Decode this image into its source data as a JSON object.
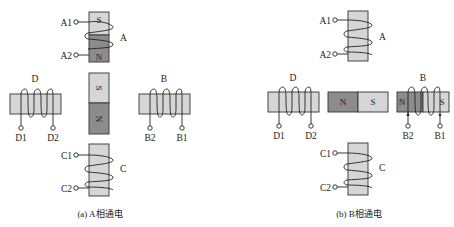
{
  "panels": [
    {
      "id": "a",
      "caption": "(a) A相通电",
      "coils": {
        "A": {
          "label": "A",
          "t1": "A1",
          "t2": "A2",
          "pole_top": "S",
          "pole_bottom": "N"
        },
        "B": {
          "label": "B",
          "t1": "B2",
          "t2": "B1"
        },
        "C": {
          "label": "C",
          "t1": "C2",
          "t2": "C1"
        },
        "D": {
          "label": "D",
          "t1": "D1",
          "t2": "D2"
        }
      },
      "rotor": {
        "top": "S",
        "bottom": "N",
        "orientation": "vertical"
      }
    },
    {
      "id": "b",
      "caption": "(b) B相通电",
      "coils": {
        "A": {
          "label": "A",
          "t1": "A1",
          "t2": "A2"
        },
        "B": {
          "label": "B",
          "t1": "B2",
          "t2": "B1",
          "pole_left": "N",
          "pole_right": "S"
        },
        "C": {
          "label": "C",
          "t1": "C2",
          "t2": "C1"
        },
        "D": {
          "label": "D",
          "t1": "D1",
          "t2": "D2"
        }
      },
      "rotor": {
        "left": "N",
        "right": "S",
        "orientation": "horizontal"
      }
    }
  ],
  "colors": {
    "core": "#d6d6d6",
    "energized": "#8c8c8c",
    "line": "#222222"
  }
}
